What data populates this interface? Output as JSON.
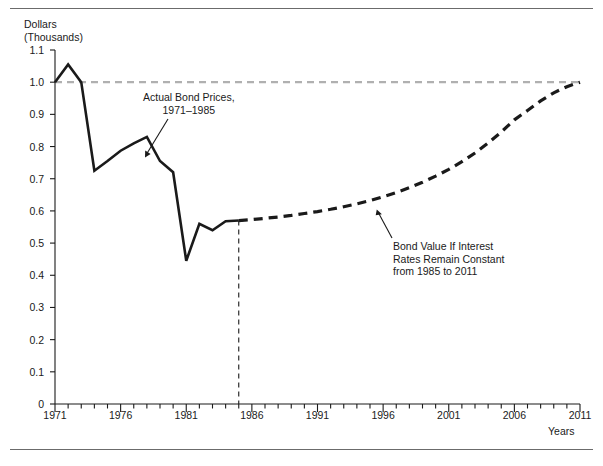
{
  "figure": {
    "y_axis_title": "Dollars\n(Thousands)",
    "x_axis_title": "Years",
    "annotation_actual": "Actual Bond Prices,\n1971–1985",
    "annotation_forecast": "Bond Value If Interest\nRates Remain Constant\nfrom 1985 to 2011"
  },
  "chart_data": {
    "type": "line",
    "title": "",
    "xlabel": "Years",
    "ylabel": "Dollars (Thousands)",
    "xlim": [
      1971,
      2011
    ],
    "ylim": [
      0,
      1.1
    ],
    "grid": false,
    "legend_position": "none",
    "y_ticks": [
      "0",
      "0.1",
      "0.2",
      "0.3",
      "0.4",
      "0.5",
      "0.6",
      "0.7",
      "0.8",
      "0.9",
      "1.0",
      "1.1"
    ],
    "y_tick_values": [
      0,
      0.1,
      0.2,
      0.3,
      0.4,
      0.5,
      0.6,
      0.7,
      0.8,
      0.9,
      1.0,
      1.1
    ],
    "x_ticks": [
      "1971",
      "1976",
      "1981",
      "1986",
      "1991",
      "1996",
      "2001",
      "2006",
      "2011"
    ],
    "x_tick_values": [
      1971,
      1976,
      1981,
      1986,
      1991,
      1996,
      2001,
      2006,
      2011
    ],
    "x_minor_tick_interval": 1,
    "series": [
      {
        "name": "Actual Bond Prices, 1971–1985",
        "style": "solid",
        "color": "#1a1a1a",
        "x": [
          1971,
          1972,
          1973,
          1974,
          1975,
          1976,
          1977,
          1978,
          1979,
          1980,
          1981,
          1982,
          1983,
          1984,
          1985
        ],
        "values": [
          1.0,
          1.055,
          1.0,
          0.725,
          0.755,
          0.787,
          0.81,
          0.83,
          0.755,
          0.72,
          0.445,
          0.56,
          0.54,
          0.568,
          0.57
        ]
      },
      {
        "name": "Bond Value If Interest Rates Remain Constant from 1985 to 2011",
        "style": "dashed",
        "color": "#1a1a1a",
        "x": [
          1985,
          1986,
          1987,
          1988,
          1989,
          1990,
          1991,
          1992,
          1993,
          1994,
          1995,
          1996,
          1997,
          1998,
          1999,
          2000,
          2001,
          2002,
          2003,
          2004,
          2005,
          2006,
          2007,
          2008,
          2009,
          2010,
          2011
        ],
        "values": [
          0.57,
          0.573,
          0.577,
          0.581,
          0.586,
          0.592,
          0.598,
          0.605,
          0.613,
          0.622,
          0.632,
          0.644,
          0.657,
          0.672,
          0.689,
          0.708,
          0.729,
          0.753,
          0.78,
          0.811,
          0.845,
          0.883,
          0.912,
          0.942,
          0.967,
          0.986,
          1.0
        ]
      }
    ],
    "reference_lines": [
      {
        "name": "par-value-line",
        "orientation": "horizontal",
        "value": 1.0,
        "style": "dashed",
        "color": "#b0b0b0"
      },
      {
        "name": "forecast-divider-line",
        "orientation": "vertical",
        "value": 1985,
        "style": "dashed",
        "color": "#1a1a1a"
      }
    ]
  }
}
